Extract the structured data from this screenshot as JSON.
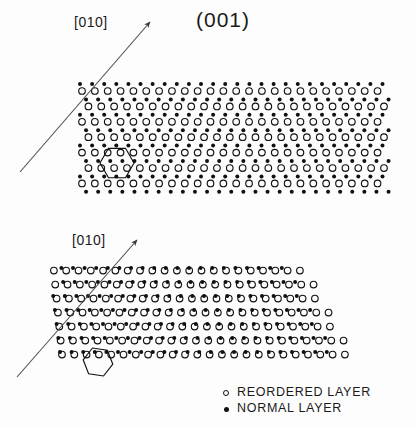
{
  "figure": {
    "title": "(001)",
    "background_color": "#fdfdfd",
    "ink_color": "#111111"
  },
  "panels": [
    {
      "id": "top",
      "direction_label": "[010]",
      "arrow": {
        "x1": 20,
        "y1": 172,
        "x2": 150,
        "y2": 22
      },
      "shape": "rectangular-band",
      "unit_cell_marker": "hexagon"
    },
    {
      "id": "bottom",
      "direction_label": "[010]",
      "arrow": {
        "x1": 17,
        "y1": 377,
        "x2": 137,
        "y2": 240
      },
      "shape": "sheared-band",
      "unit_cell_marker": "hexagon"
    }
  ],
  "legend": {
    "items": [
      {
        "marker": "open-circle",
        "label": "REORDERED LAYER"
      },
      {
        "marker": "filled-circle",
        "label": "NORMAL LAYER"
      }
    ]
  },
  "chart_data": {
    "type": "scatter",
    "title": "(001)",
    "xlabel": "",
    "ylabel": "",
    "series": [
      {
        "name": "NORMAL LAYER",
        "marker": "filled-circle",
        "color": "#111111"
      },
      {
        "name": "REORDERED LAYER",
        "marker": "open-circle",
        "color": "#111111"
      }
    ],
    "annotations": [
      {
        "text": "[010]",
        "panel": "top",
        "type": "direction-arrow"
      },
      {
        "text": "[010]",
        "panel": "bottom",
        "type": "direction-arrow"
      },
      {
        "text": "(001)",
        "panel": "top",
        "type": "title"
      }
    ],
    "lattice_top": {
      "normal_rows": 8,
      "normal_cols": 26,
      "normal_spacing_x": 12.1,
      "normal_spacing_y": 15.4,
      "normal_origin": [
        80,
        84
      ],
      "reordered_spacing_x": 12.85,
      "reordered_spacing_y": 15.4,
      "reordered_origin": [
        82,
        91
      ],
      "x_range": [
        78,
        392
      ],
      "y_range": [
        80,
        190
      ]
    },
    "lattice_bottom": {
      "normal_rows": 9,
      "normal_cols": 24,
      "normal_spacing_x": 11.6,
      "normal_spacing_y": 14.0,
      "shear_per_row": 7.5,
      "normal_origin": [
        60,
        352
      ],
      "reordered_spacing_x": 12.3,
      "reordered_spacing_y": 14.0,
      "x_range": [
        55,
        358
      ],
      "y_range": [
        258,
        375
      ]
    },
    "grid": false,
    "legend_position": "bottom-right"
  }
}
